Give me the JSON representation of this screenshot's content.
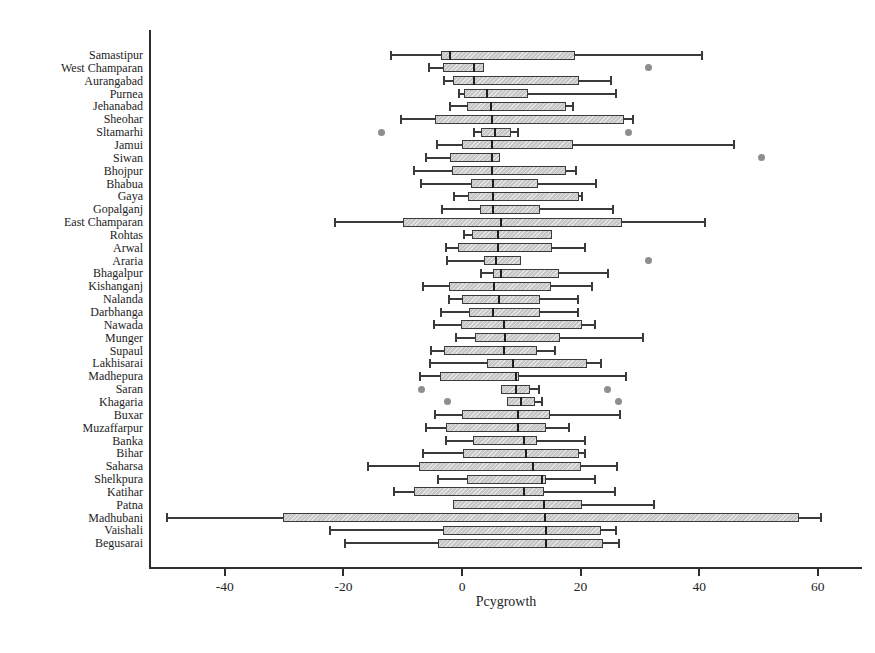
{
  "chart_data": {
    "type": "boxplot",
    "orientation": "horizontal",
    "title": "",
    "xlabel": "Pcygrowth",
    "ylabel": "",
    "xlim": [
      -52,
      68
    ],
    "grid": false,
    "legend": null,
    "x_ticks": [
      -40,
      -20,
      0,
      20,
      40,
      60
    ],
    "x_tick_labels": [
      "-40",
      "-20",
      "0",
      "20",
      "40",
      "60"
    ],
    "districts": [
      {
        "name": "Samastipur",
        "lo": -12.0,
        "q1": -3.5,
        "med": -2.0,
        "q3": 19.0,
        "hi": 40.5,
        "outliers": []
      },
      {
        "name": "West Champaran",
        "lo": -5.5,
        "q1": -3.2,
        "med": 2.0,
        "q3": 3.7,
        "hi": 3.7,
        "outliers": [
          31.5
        ]
      },
      {
        "name": "Aurangabad",
        "lo": -3.0,
        "q1": -1.5,
        "med": 2.0,
        "q3": 19.8,
        "hi": 25.2,
        "outliers": []
      },
      {
        "name": "Purnea",
        "lo": -0.5,
        "q1": 0.3,
        "med": 4.2,
        "q3": 11.2,
        "hi": 26.0,
        "outliers": []
      },
      {
        "name": "Jehanabad",
        "lo": -2.0,
        "q1": 0.8,
        "med": 4.9,
        "q3": 17.5,
        "hi": 18.8,
        "outliers": []
      },
      {
        "name": "Sheohar",
        "lo": -10.3,
        "q1": -4.6,
        "med": 5.1,
        "q3": 27.3,
        "hi": 28.8,
        "outliers": []
      },
      {
        "name": "Sltamarhi",
        "lo": 2.0,
        "q1": 3.2,
        "med": 5.5,
        "q3": 8.3,
        "hi": 9.5,
        "outliers": [
          -13.6,
          28.0
        ]
      },
      {
        "name": "Jamui",
        "lo": -4.2,
        "q1": 0.0,
        "med": 5.1,
        "q3": 18.8,
        "hi": 45.8,
        "outliers": []
      },
      {
        "name": "Siwan",
        "lo": -6.0,
        "q1": -2.0,
        "med": 5.0,
        "q3": 6.4,
        "hi": 6.4,
        "outliers": [
          50.5
        ]
      },
      {
        "name": "Bhojpur",
        "lo": -8.1,
        "q1": -1.7,
        "med": 5.1,
        "q3": 17.6,
        "hi": 19.2,
        "outliers": []
      },
      {
        "name": "Bhabua",
        "lo": -6.9,
        "q1": 1.5,
        "med": 5.3,
        "q3": 12.9,
        "hi": 22.6,
        "outliers": []
      },
      {
        "name": "Gaya",
        "lo": -1.4,
        "q1": 1.0,
        "med": 5.3,
        "q3": 19.8,
        "hi": 20.3,
        "outliers": []
      },
      {
        "name": "Gopalganj",
        "lo": -3.4,
        "q1": 3.1,
        "med": 5.3,
        "q3": 13.2,
        "hi": 25.4,
        "outliers": []
      },
      {
        "name": "East Champaran",
        "lo": -21.4,
        "q1": -10.0,
        "med": 6.5,
        "q3": 27.0,
        "hi": 41.0,
        "outliers": []
      },
      {
        "name": "Rohtas",
        "lo": 0.3,
        "q1": 1.7,
        "med": 6.1,
        "q3": 15.1,
        "hi": 15.1,
        "outliers": []
      },
      {
        "name": "Arwal",
        "lo": -2.7,
        "q1": -0.7,
        "med": 6.1,
        "q3": 15.1,
        "hi": 20.8,
        "outliers": []
      },
      {
        "name": "Araria",
        "lo": -2.5,
        "q1": 3.7,
        "med": 5.8,
        "q3": 10.0,
        "hi": 10.0,
        "outliers": [
          31.5
        ]
      },
      {
        "name": "Bhagalpur",
        "lo": 3.2,
        "q1": 5.3,
        "med": 6.5,
        "q3": 16.4,
        "hi": 24.6,
        "outliers": []
      },
      {
        "name": "Kishanganj",
        "lo": -6.5,
        "q1": -2.2,
        "med": 5.4,
        "q3": 15.0,
        "hi": 22.0,
        "outliers": []
      },
      {
        "name": "Nalanda",
        "lo": -2.2,
        "q1": 0.0,
        "med": 6.3,
        "q3": 13.1,
        "hi": 19.6,
        "outliers": []
      },
      {
        "name": "Darbhanga",
        "lo": -3.6,
        "q1": 1.2,
        "med": 5.3,
        "q3": 13.1,
        "hi": 19.5,
        "outliers": []
      },
      {
        "name": "Nawada",
        "lo": -4.7,
        "q1": -0.2,
        "med": 7.1,
        "q3": 20.2,
        "hi": 22.5,
        "outliers": []
      },
      {
        "name": "Munger",
        "lo": -1.0,
        "q1": 2.2,
        "med": 7.3,
        "q3": 16.6,
        "hi": 30.5,
        "outliers": []
      },
      {
        "name": "Supaul",
        "lo": -5.2,
        "q1": -3.0,
        "med": 7.0,
        "q3": 12.6,
        "hi": 15.6,
        "outliers": []
      },
      {
        "name": "Lakhisarai",
        "lo": -5.4,
        "q1": 4.2,
        "med": 8.6,
        "q3": 21.0,
        "hi": 23.4,
        "outliers": []
      },
      {
        "name": "Madhepura",
        "lo": -7.1,
        "q1": -3.7,
        "med": 9.1,
        "q3": 9.6,
        "hi": 27.6,
        "outliers": []
      },
      {
        "name": "Saran",
        "lo": 6.5,
        "q1": 6.5,
        "med": 9.1,
        "q3": 11.5,
        "hi": 13.0,
        "outliers": [
          -6.8,
          24.5
        ]
      },
      {
        "name": "Khagaria",
        "lo": 7.6,
        "q1": 7.6,
        "med": 10.0,
        "q3": 12.3,
        "hi": 13.5,
        "outliers": [
          -2.5,
          26.4
        ]
      },
      {
        "name": "Buxar",
        "lo": -4.5,
        "q1": 0.0,
        "med": 9.4,
        "q3": 14.8,
        "hi": 26.7,
        "outliers": []
      },
      {
        "name": "Muzaffarpur",
        "lo": -6.0,
        "q1": -2.7,
        "med": 9.5,
        "q3": 14.2,
        "hi": 18.0,
        "outliers": []
      },
      {
        "name": "Banka",
        "lo": -2.7,
        "q1": 1.9,
        "med": 10.5,
        "q3": 12.7,
        "hi": 20.8,
        "outliers": []
      },
      {
        "name": "Bihar",
        "lo": -6.6,
        "q1": 0.2,
        "med": 10.8,
        "q3": 19.8,
        "hi": 20.7,
        "outliers": []
      },
      {
        "name": "Saharsa",
        "lo": -15.8,
        "q1": -7.3,
        "med": 12.0,
        "q3": 20.0,
        "hi": 26.1,
        "outliers": []
      },
      {
        "name": "Shelkpura",
        "lo": -4.1,
        "q1": 0.8,
        "med": 13.5,
        "q3": 14.2,
        "hi": 22.5,
        "outliers": []
      },
      {
        "name": "Katihar",
        "lo": -11.4,
        "q1": -8.1,
        "med": 10.5,
        "q3": 13.9,
        "hi": 25.8,
        "outliers": []
      },
      {
        "name": "Patna",
        "lo": -1.6,
        "q1": -1.6,
        "med": 13.9,
        "q3": 20.2,
        "hi": 32.4,
        "outliers": []
      },
      {
        "name": "Madhubani",
        "lo": -49.8,
        "q1": -30.2,
        "med": 14.0,
        "q3": 56.8,
        "hi": 60.5,
        "outliers": []
      },
      {
        "name": "Vaishali",
        "lo": -22.2,
        "q1": -3.2,
        "med": 14.1,
        "q3": 23.5,
        "hi": 26.0,
        "outliers": []
      },
      {
        "name": "Begusarai",
        "lo": -19.8,
        "q1": -4.1,
        "med": 14.2,
        "q3": 23.8,
        "hi": 26.5,
        "outliers": []
      }
    ]
  },
  "colors": {
    "background": "#ffffff",
    "box_fill": "#c6c6c6",
    "box_border": "#3a3a3a",
    "median": "#1e1e1e",
    "whisker": "#3a3a3a",
    "outlier_dot": "#8e8e8e",
    "text": "#1c1c1c"
  }
}
